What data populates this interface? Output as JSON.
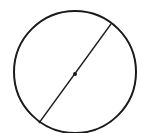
{
  "diagram": {
    "type": "circle-with-diameter",
    "stroke_color": "#1a1a1a",
    "background": "#ffffff",
    "circle": {
      "cx": 75,
      "cy": 72,
      "r": 61,
      "stroke_width": 2
    },
    "diameter": {
      "x1": 39,
      "y1": 123,
      "x2": 111,
      "y2": 24,
      "stroke_width": 1.3
    },
    "center_point": {
      "cx": 75,
      "cy": 74,
      "r": 2
    }
  }
}
